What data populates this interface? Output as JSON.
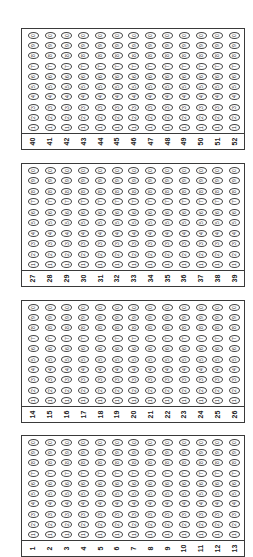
{
  "sheet": {
    "type": "answer-bubble-sheet",
    "orientation": "rotated-90-ccw",
    "bubble_digits_top_to_bottom": [
      "0",
      "9",
      "8",
      "7",
      "6",
      "5",
      "4",
      "3",
      "2",
      "1"
    ],
    "blocks": [
      {
        "top": 28,
        "height": 122,
        "questions": [
          "40",
          "41",
          "42",
          "43",
          "44",
          "45",
          "46",
          "47",
          "48",
          "49",
          "50",
          "51",
          "52"
        ]
      },
      {
        "top": 163,
        "height": 124,
        "questions": [
          "27",
          "28",
          "29",
          "30",
          "31",
          "32",
          "33",
          "34",
          "35",
          "36",
          "37",
          "38",
          "39"
        ]
      },
      {
        "top": 300,
        "height": 123,
        "questions": [
          "14",
          "15",
          "16",
          "17",
          "18",
          "19",
          "20",
          "21",
          "22",
          "23",
          "24",
          "25",
          "26"
        ]
      },
      {
        "top": 435,
        "height": 122,
        "questions": [
          "1",
          "2",
          "3",
          "4",
          "5",
          "6",
          "7",
          "8",
          "9",
          "10",
          "11",
          "12",
          "13"
        ]
      }
    ]
  }
}
